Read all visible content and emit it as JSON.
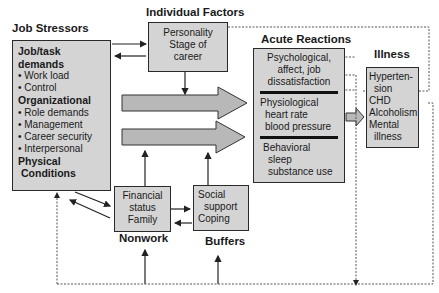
{
  "job_stressors": {
    "title": "Job Stressors",
    "groups": [
      {
        "heading": "Job/task demands",
        "items": [
          "• Work load",
          "• Control"
        ]
      },
      {
        "heading": "Organizational",
        "items": [
          "• Role demands",
          "• Management",
          "• Career security",
          "• Interpersonal"
        ]
      },
      {
        "heading": "Physical",
        "items": []
      },
      {
        "heading": "Conditions",
        "items": []
      }
    ]
  },
  "individual_factors": {
    "title": "Individual Factors",
    "lines": [
      "Personality",
      "Stage of",
      "career"
    ]
  },
  "acute_reactions": {
    "title": "Acute Reactions",
    "sections": [
      {
        "lines": [
          "Psychological,",
          "affect,  job",
          "dissatisfaction"
        ]
      },
      {
        "lines": [
          "Physiological",
          "heart rate",
          "blood pressure"
        ]
      },
      {
        "lines": [
          "Behavioral",
          "sleep",
          "substance use"
        ]
      }
    ]
  },
  "illness": {
    "title": "Illness",
    "lines": [
      "Hyperten-",
      "sion",
      "CHD",
      "Alcoholism",
      "Mental",
      "illness"
    ]
  },
  "nonwork": {
    "title": "Nonwork",
    "lines": [
      "Financial",
      "status",
      "Family"
    ]
  },
  "buffers": {
    "title": "Buffers",
    "lines": [
      "Social",
      "support",
      "Coping"
    ]
  },
  "colors": {
    "box_fill": "#d4d4d4",
    "border": "#2a2a2a",
    "arrow_fill": "#b8b8b8"
  }
}
